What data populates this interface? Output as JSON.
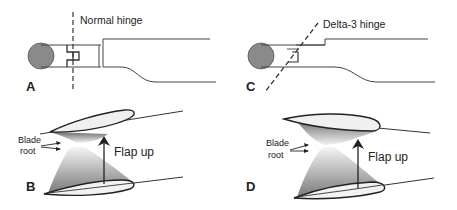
{
  "figure": {
    "panels": [
      {
        "id": "A",
        "letter": "A",
        "hinge_label": "Normal hinge",
        "hinge_type": "normal"
      },
      {
        "id": "B",
        "letter": "B",
        "annotation_label": "Flap up",
        "root_label_line1": "Blade",
        "root_label_line2": "root"
      },
      {
        "id": "C",
        "letter": "C",
        "hinge_label": "Delta-3 hinge",
        "hinge_type": "delta-3"
      },
      {
        "id": "D",
        "letter": "D",
        "annotation_label": "Flap up",
        "root_label_line1": "Blade",
        "root_label_line2": "root"
      }
    ],
    "colors": {
      "hub_fill": "#8a8a8a",
      "line": "#333333",
      "shade_dark": "#7a7a7a",
      "shade_light": "#f0f0f0",
      "background": "#ffffff"
    }
  }
}
